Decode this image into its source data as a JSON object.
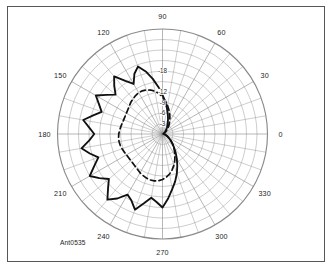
{
  "figure": {
    "identifier": "Ant0535",
    "background_color": "#ffffff",
    "border_color": "#55555a",
    "grid_color": "#8a8a8a",
    "trace_color": "#111111"
  },
  "chart_data": {
    "type": "line",
    "plot_style": "polar",
    "title": "",
    "subtitle": "",
    "xlabel": "",
    "ylabel": "",
    "grid": true,
    "legend_position": "none",
    "annotations": [
      "Ant0535"
    ],
    "angle_unit": "degrees",
    "angle_direction": "counterclockwise",
    "angle_zero_at": "east",
    "angle_tick_step": 10,
    "angle_label_step": 30,
    "angle_ticks": [
      0,
      30,
      60,
      90,
      120,
      150,
      180,
      210,
      240,
      270,
      300,
      330
    ],
    "angle_tick_labels": [
      "0",
      "30",
      "60",
      "90",
      "120",
      "150",
      "180",
      "210",
      "240",
      "270",
      "300",
      "330"
    ],
    "radial_unit": "dB",
    "radial_tick_labels": [
      "-3",
      "-6",
      "-9",
      "-12",
      "-18"
    ],
    "radial_tick_values": [
      -3,
      -6,
      -9,
      -12,
      -18
    ],
    "radial_label_axis_angle": 90,
    "rlim": [
      -30,
      0
    ],
    "n_radial_circles": 10,
    "series": [
      {
        "name": "solid",
        "linestyle": "solid",
        "color": "#111111",
        "x": [
          0,
          5,
          10,
          15,
          20,
          25,
          30,
          35,
          40,
          45,
          50,
          55,
          60,
          65,
          70,
          75,
          80,
          85,
          90,
          95,
          100,
          105,
          110,
          115,
          120,
          125,
          130,
          135,
          140,
          145,
          150,
          155,
          160,
          165,
          170,
          175,
          180,
          185,
          190,
          195,
          200,
          205,
          210,
          215,
          220,
          225,
          230,
          235,
          240,
          245,
          250,
          255,
          260,
          265,
          270,
          275,
          280,
          285,
          290,
          295,
          300,
          305,
          310,
          315,
          320,
          325,
          330,
          335,
          340,
          345,
          350,
          355
        ],
        "values": [
          -0.6,
          -0.5,
          -0.4,
          -0.4,
          -0.4,
          -0.5,
          -0.6,
          -0.8,
          -1.0,
          -1.3,
          -1.7,
          -2.2,
          -2.8,
          -3.6,
          -4.6,
          -5.9,
          -7.4,
          -9.2,
          -11.2,
          -13.5,
          -16.0,
          -18.5,
          -20.5,
          -19.0,
          -16.5,
          -18.5,
          -21.5,
          -19.5,
          -17.5,
          -19.5,
          -22.0,
          -20.0,
          -18.5,
          -20.5,
          -23.0,
          -21.0,
          -19.5,
          -21.0,
          -23.5,
          -21.5,
          -19.5,
          -21.5,
          -24.0,
          -22.0,
          -20.0,
          -22.0,
          -24.5,
          -22.5,
          -20.0,
          -21.0,
          -23.0,
          -20.5,
          -18.5,
          -19.5,
          -21.0,
          -18.5,
          -16.0,
          -14.0,
          -12.0,
          -10.0,
          -8.2,
          -6.6,
          -5.2,
          -4.1,
          -3.2,
          -2.5,
          -1.9,
          -1.5,
          -1.1,
          -0.9,
          -0.7,
          -0.6
        ]
      },
      {
        "name": "dashed",
        "linestyle": "dashed",
        "color": "#111111",
        "x": [
          0,
          5,
          10,
          15,
          20,
          25,
          30,
          35,
          40,
          45,
          50,
          55,
          60,
          65,
          70,
          75,
          80,
          85,
          90,
          95,
          100,
          105,
          110,
          115,
          120,
          125,
          130,
          135,
          140,
          145,
          150,
          155,
          160,
          165,
          170,
          175,
          180,
          185,
          190,
          195,
          200,
          205,
          210,
          215,
          220,
          225,
          230,
          235,
          240,
          245,
          250,
          255,
          260,
          265,
          270,
          275,
          280,
          285,
          290,
          295,
          300,
          305,
          310,
          315,
          320,
          325,
          330,
          335,
          340,
          345,
          350,
          355
        ],
        "values": [
          -0.2,
          -0.2,
          -0.2,
          -0.3,
          -0.4,
          -0.6,
          -0.8,
          -1.1,
          -1.5,
          -2.0,
          -2.6,
          -3.3,
          -4.1,
          -5.0,
          -6.0,
          -7.1,
          -8.3,
          -9.5,
          -10.6,
          -11.6,
          -12.4,
          -13.0,
          -13.4,
          -13.6,
          -13.6,
          -13.4,
          -13.1,
          -12.8,
          -12.4,
          -12.1,
          -11.9,
          -11.8,
          -11.8,
          -11.9,
          -12.1,
          -12.3,
          -12.5,
          -12.6,
          -12.6,
          -12.5,
          -12.3,
          -12.1,
          -11.9,
          -11.8,
          -11.8,
          -11.9,
          -12.1,
          -12.4,
          -12.8,
          -13.1,
          -13.4,
          -13.6,
          -13.6,
          -13.4,
          -13.0,
          -12.4,
          -11.6,
          -10.6,
          -9.5,
          -8.3,
          -7.1,
          -6.0,
          -5.0,
          -4.1,
          -3.3,
          -2.6,
          -2.0,
          -1.5,
          -1.1,
          -0.8,
          -0.5,
          -0.3
        ]
      }
    ]
  }
}
